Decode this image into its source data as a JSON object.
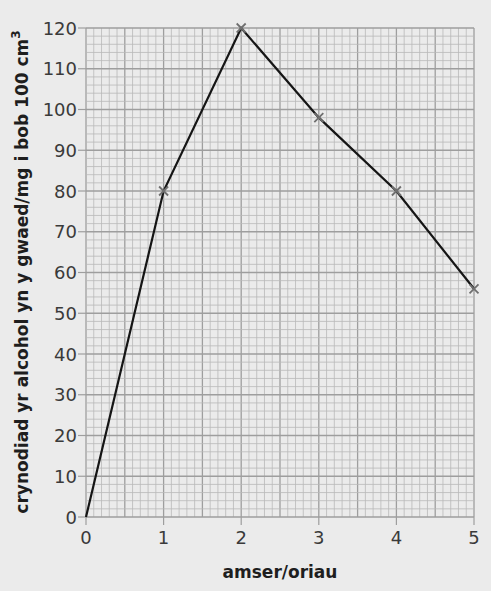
{
  "chart_data": {
    "type": "line",
    "title": "",
    "xlabel": "amser/oriau",
    "ylabel": "crynodiad yr alcohol yn y gwaed/mg i bob 100 cm³",
    "ylabel_main": "crynodiad yr alcohol yn y gwaed/mg i bob 100 cm",
    "ylabel_sup": "3",
    "x": [
      0,
      1,
      2,
      3,
      4,
      5
    ],
    "series": [
      {
        "name": "blood alcohol concentration",
        "values": [
          0,
          80,
          120,
          98,
          80,
          56
        ],
        "markers": "cross",
        "marked_points": [
          1,
          2,
          3,
          4,
          5
        ]
      }
    ],
    "xlim": [
      0,
      5
    ],
    "ylim": [
      0,
      120
    ],
    "x_ticks": [
      0,
      1,
      2,
      3,
      4,
      5
    ],
    "y_ticks": [
      0,
      10,
      20,
      30,
      40,
      50,
      60,
      70,
      80,
      90,
      100,
      110,
      120
    ],
    "x_minor_per_major": 10,
    "y_minor_step": 2,
    "grid": true,
    "legend": "none"
  },
  "style": {
    "background": "#ebebeb",
    "grid_minor": "#b9b9b9",
    "grid_major": "#9e9e9e",
    "line_color": "#151515",
    "marker_color": "#6f6f6f"
  }
}
